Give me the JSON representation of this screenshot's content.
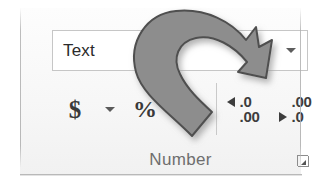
{
  "group": {
    "name": "Number",
    "label": "Number",
    "dialog_launcher_name": "Number Format dialog launcher"
  },
  "format_combo": {
    "value": "Text",
    "placeholder": "General",
    "caret_icon": "chevron-down-icon"
  },
  "commands": [
    {
      "id": "accounting-number-format",
      "label": "$",
      "icon": "dollar-sign-icon"
    },
    {
      "id": "accounting-number-format-menu",
      "label": "",
      "icon": "chevron-down-icon"
    },
    {
      "id": "percent-style",
      "label": "%",
      "icon": "percent-sign-icon"
    }
  ],
  "decimal_buttons": [
    {
      "id": "increase-decimal",
      "icon": "increase-decimal-icon",
      "top_line": ".0",
      "bottom_line": ".00",
      "arrow": "arrow-left",
      "arrow_row": "top"
    },
    {
      "id": "decrease-decimal",
      "icon": "decrease-decimal-icon",
      "top_line": ".00",
      "bottom_line": ".0",
      "arrow": "arrow-right",
      "arrow_row": "bottom"
    }
  ],
  "annotation": {
    "type": "curved-arrow-callout",
    "fill": "#8d8d8d",
    "stroke": "#4f4f4f",
    "shadow": "#b5b5b5",
    "points_to": "format-combo"
  },
  "colors": {
    "panel_background": "#f7f7f7",
    "combo_background": "#ffffff",
    "combo_border": "#c6c6c6",
    "text": "#2b2b2b",
    "label_text": "#6e6e6e",
    "glyph": "#3a3a3a",
    "separator": "#b2b2b2"
  }
}
